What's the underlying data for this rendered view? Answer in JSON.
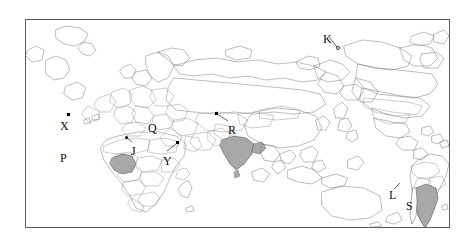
{
  "figure": {
    "type": "world-map",
    "background_color": "#ffffff",
    "frame_color": "#5a5a5a",
    "coastline_color": "#6e6e6e",
    "border_color": "#8c8c8c",
    "highlight_fill": "#a8a8a8",
    "label_color": "#111111",
    "frame": {
      "x": 25,
      "y": 19,
      "width": 425,
      "height": 209
    }
  },
  "labels": [
    {
      "id": "label-x",
      "text": "X",
      "x": 60,
      "y": 120
    },
    {
      "id": "label-p",
      "text": "P",
      "x": 60,
      "y": 152
    },
    {
      "id": "label-j",
      "text": "J",
      "x": 131,
      "y": 145
    },
    {
      "id": "label-q",
      "text": "Q",
      "x": 148,
      "y": 122
    },
    {
      "id": "label-y",
      "text": "Y",
      "x": 163,
      "y": 155
    },
    {
      "id": "label-r",
      "text": "R",
      "x": 228,
      "y": 124
    },
    {
      "id": "label-k",
      "text": "K",
      "x": 323,
      "y": 33
    },
    {
      "id": "label-l",
      "text": "L",
      "x": 389,
      "y": 189
    },
    {
      "id": "label-s",
      "text": "S",
      "x": 406,
      "y": 200
    }
  ],
  "markers": [
    {
      "id": "marker-x",
      "shape": "square",
      "x": 67,
      "y": 113
    },
    {
      "id": "marker-y",
      "shape": "square",
      "x": 176,
      "y": 141
    },
    {
      "id": "marker-r",
      "shape": "square",
      "x": 215,
      "y": 112
    },
    {
      "id": "marker-k",
      "shape": "ring",
      "x": 336,
      "y": 46
    },
    {
      "id": "marker-j",
      "shape": "dot",
      "x": 124,
      "y": 136
    }
  ],
  "leaders": [
    {
      "id": "leader-y",
      "x1": 166,
      "y1": 150,
      "x2": 176,
      "y2": 142
    },
    {
      "id": "leader-r",
      "x1": 227,
      "y1": 120,
      "x2": 216,
      "y2": 113
    },
    {
      "id": "leader-k",
      "x1": 328,
      "y1": 36,
      "x2": 336,
      "y2": 46
    },
    {
      "id": "leader-j",
      "x1": 131,
      "y1": 141,
      "x2": 125,
      "y2": 136
    },
    {
      "id": "leader-l",
      "x1": 393,
      "y1": 188,
      "x2": 399,
      "y2": 182
    }
  ],
  "highlighted_regions": [
    {
      "id": "region-nigeria",
      "label": "P"
    },
    {
      "id": "region-india",
      "label": "Q"
    },
    {
      "id": "region-argentina",
      "label": "S"
    }
  ]
}
